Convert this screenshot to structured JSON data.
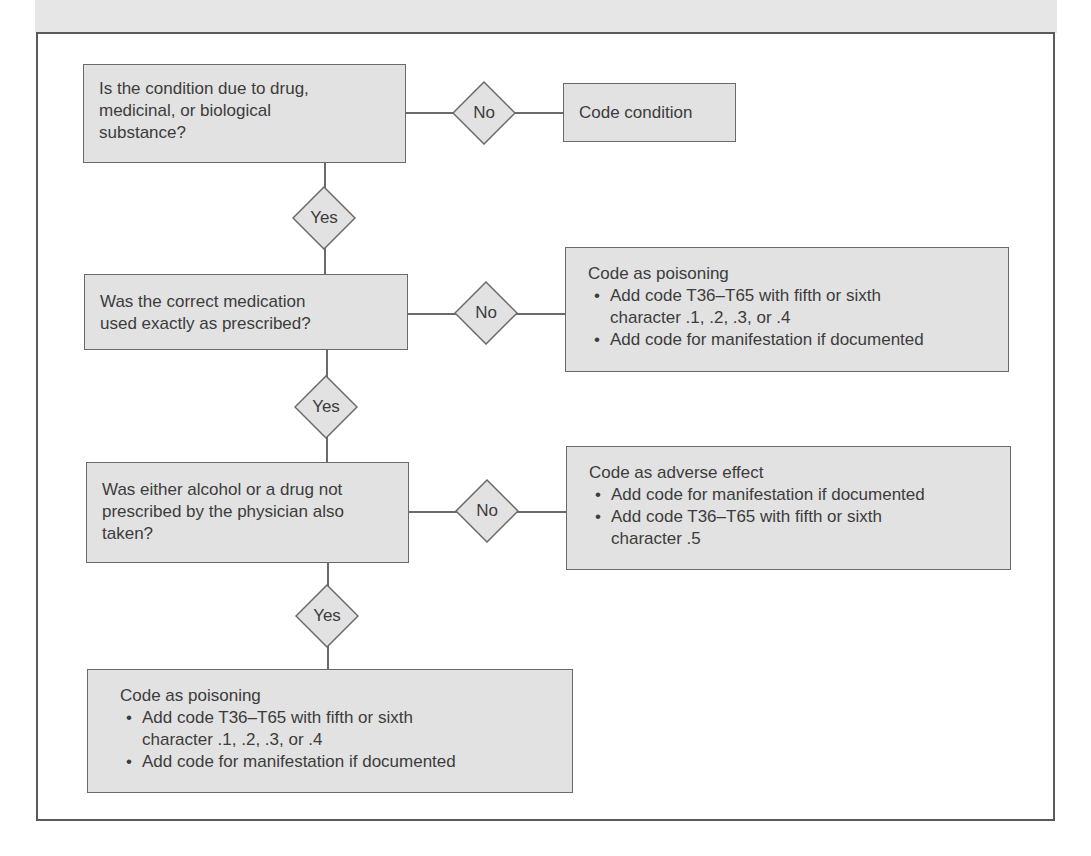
{
  "flowchart": {
    "decisions": [
      {
        "question": "Is the condition due to drug, medicinal, or biological substance?",
        "lines": [
          "Is the condition due to drug,",
          "medicinal, or biological",
          "substance?"
        ],
        "no_label": "No",
        "yes_label": "Yes",
        "no_outcome": {
          "title": "Code condition",
          "bullets": []
        }
      },
      {
        "question": "Was the correct medication used exactly as prescribed?",
        "lines": [
          "Was the correct medication",
          "used exactly as prescribed?"
        ],
        "no_label": "No",
        "yes_label": "Yes",
        "no_outcome": {
          "title": "Code as poisoning",
          "bullets": [
            "Add code T36–T65 with fifth or sixth character .1, .2, .3, or .4",
            "Add code for manifestation if documented"
          ]
        }
      },
      {
        "question": "Was either alcohol or a drug not prescribed by the physician also taken?",
        "lines": [
          "Was either alcohol or a drug not",
          "prescribed by the physician also",
          "taken?"
        ],
        "no_label": "No",
        "yes_label": "Yes",
        "no_outcome": {
          "title": "Code as adverse effect",
          "bullets": [
            "Add code for manifestation if documented",
            "Add code T36–T65 with fifth or sixth character .5"
          ]
        }
      }
    ],
    "final_yes_outcome": {
      "title": "Code as poisoning",
      "bullets": [
        "Add code T36–T65 with fifth or sixth character .1, .2, .3, or .4",
        "Add code for manifestation if documented"
      ]
    }
  },
  "colors": {
    "box_fill": "#e2e2e2",
    "line": "#6a6a6a",
    "text": "#3c3c3c"
  }
}
